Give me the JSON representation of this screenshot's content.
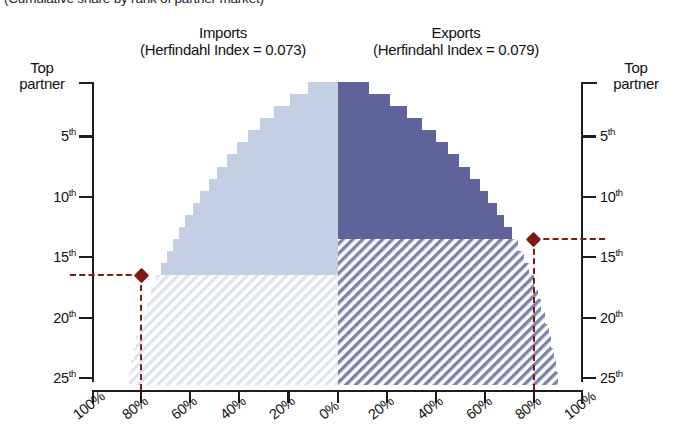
{
  "caption": "(Cumulative share by rank of partner market)",
  "panels": {
    "imports": {
      "title": "Imports",
      "subtitle": "(Herfindahl Index = 0.073)",
      "color": "#c3d0e4",
      "hatch_color": "#d8e0ee"
    },
    "exports": {
      "title": "Exports",
      "subtitle": "(Herfindahl Index = 0.079)",
      "color": "#5e639a",
      "hatch_color": "#7c82ad"
    }
  },
  "axes": {
    "y_left_top_label": "Top\npartner",
    "y_left_top_line1": "Top",
    "y_left_top_line2": "partner",
    "y_right_top_line1": "Top",
    "y_right_top_line2": "partner",
    "y_ticks": [
      "5",
      "10",
      "15",
      "20",
      "25"
    ],
    "y_tick_suffix": "th",
    "x_ticks_left": [
      "100%",
      "80%",
      "60%",
      "40%",
      "20%",
      "0%"
    ],
    "x_ticks_right": [
      "20%",
      "40%",
      "60%",
      "80%",
      "100%"
    ],
    "x_all_ticks": [
      "100%",
      "80%",
      "60%",
      "40%",
      "20%",
      "0%",
      "20%",
      "40%",
      "60%",
      "80%",
      "100%"
    ],
    "y_range": [
      1,
      26
    ],
    "x_range_pct": [
      0,
      100
    ]
  },
  "markers": {
    "imports": {
      "rank": 16,
      "share_pct": 80,
      "color": "#7d1a17"
    },
    "exports": {
      "rank": 13,
      "share_pct": 80,
      "color": "#7d1a17"
    }
  },
  "chart_data": {
    "type": "area",
    "subtitle": "(Cumulative share by rank of partner market)",
    "xlabel": "",
    "ylabel": "Rank of partner",
    "ylim": [
      1,
      26
    ],
    "xlim": [
      0,
      100
    ],
    "grid": false,
    "legend": "none",
    "orientation": "back-to-back cumulative staircase (tornado)",
    "ranks": [
      1,
      2,
      3,
      4,
      5,
      6,
      7,
      8,
      9,
      10,
      11,
      12,
      13,
      14,
      15,
      16,
      17,
      18,
      19,
      20,
      21,
      22,
      23,
      24,
      25
    ],
    "series": [
      {
        "name": "Imports",
        "direction": "left",
        "herfindahl_index": 0.073,
        "color": "#c3d0e4",
        "solid_until_rank": 16,
        "cumulative_share_pct": [
          12.0,
          19.5,
          26.0,
          31.5,
          36.5,
          41.0,
          45.0,
          49.0,
          52.5,
          56.0,
          59.0,
          62.0,
          64.5,
          67.0,
          69.5,
          72.0,
          74.0,
          76.0,
          77.5,
          79.0,
          80.5,
          82.0,
          83.0,
          84.0,
          85.0
        ]
      },
      {
        "name": "Exports",
        "direction": "right",
        "herfindahl_index": 0.079,
        "color": "#5e639a",
        "solid_until_rank": 13,
        "cumulative_share_pct": [
          13.0,
          21.5,
          28.5,
          34.5,
          40.0,
          45.0,
          49.5,
          54.0,
          58.0,
          61.5,
          65.0,
          68.0,
          71.0,
          73.5,
          76.0,
          78.0,
          80.0,
          81.5,
          83.0,
          84.5,
          86.0,
          87.0,
          88.0,
          89.0,
          90.0
        ]
      }
    ],
    "annotations": [
      {
        "series": "Imports",
        "rank": 16,
        "value_pct": 80,
        "marker": "diamond",
        "color": "#7d1a17"
      },
      {
        "series": "Exports",
        "rank": 13,
        "value_pct": 80,
        "marker": "diamond",
        "color": "#7d1a17"
      }
    ]
  }
}
